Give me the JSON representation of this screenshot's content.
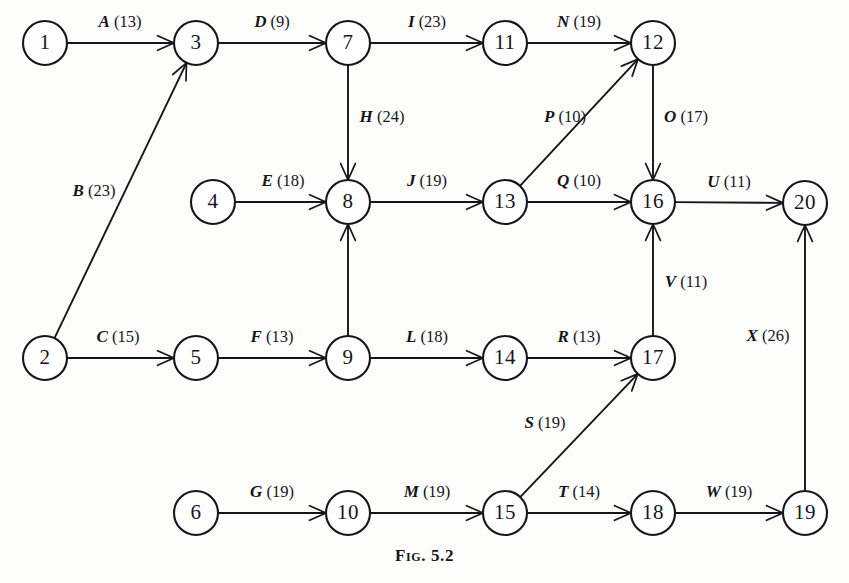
{
  "figure": {
    "caption_word": "Fig.",
    "caption_number": "5.2",
    "width": 849,
    "height": 583,
    "ink_color": "#16161a",
    "background_color": "#fdfdfb"
  },
  "chart_data": {
    "type": "diagram",
    "subtype": "activity-on-arrow-network",
    "node_radius": 22,
    "nodes": [
      {
        "id": "1",
        "label": "1",
        "x": 45,
        "y": 43
      },
      {
        "id": "3",
        "label": "3",
        "x": 196,
        "y": 43
      },
      {
        "id": "7",
        "label": "7",
        "x": 348,
        "y": 43
      },
      {
        "id": "11",
        "label": "11",
        "x": 505,
        "y": 43
      },
      {
        "id": "12",
        "label": "12",
        "x": 653,
        "y": 43
      },
      {
        "id": "4",
        "label": "4",
        "x": 213,
        "y": 202
      },
      {
        "id": "8",
        "label": "8",
        "x": 348,
        "y": 202
      },
      {
        "id": "13",
        "label": "13",
        "x": 505,
        "y": 202
      },
      {
        "id": "16",
        "label": "16",
        "x": 653,
        "y": 202
      },
      {
        "id": "20",
        "label": "20",
        "x": 805,
        "y": 203
      },
      {
        "id": "2",
        "label": "2",
        "x": 45,
        "y": 358
      },
      {
        "id": "5",
        "label": "5",
        "x": 196,
        "y": 358
      },
      {
        "id": "9",
        "label": "9",
        "x": 348,
        "y": 358
      },
      {
        "id": "14",
        "label": "14",
        "x": 505,
        "y": 358
      },
      {
        "id": "17",
        "label": "17",
        "x": 653,
        "y": 358
      },
      {
        "id": "6",
        "label": "6",
        "x": 196,
        "y": 513
      },
      {
        "id": "10",
        "label": "10",
        "x": 348,
        "y": 513
      },
      {
        "id": "15",
        "label": "15",
        "x": 505,
        "y": 513
      },
      {
        "id": "18",
        "label": "18",
        "x": 653,
        "y": 513
      },
      {
        "id": "19",
        "label": "19",
        "x": 805,
        "y": 513
      }
    ],
    "edges": [
      {
        "activity": "A",
        "duration": 13,
        "label": "A (13)",
        "from": "1",
        "to": "3",
        "lx": 120,
        "ly": 23
      },
      {
        "activity": "B",
        "duration": 23,
        "label": "B (23)",
        "from": "2",
        "to": "3",
        "lx": 94,
        "ly": 192
      },
      {
        "activity": "C",
        "duration": 15,
        "label": "C (15)",
        "from": "2",
        "to": "5",
        "lx": 118,
        "ly": 338
      },
      {
        "activity": "D",
        "duration": 9,
        "label": "D (9)",
        "from": "3",
        "to": "7",
        "lx": 272,
        "ly": 23
      },
      {
        "activity": "E",
        "duration": 18,
        "label": "E (18)",
        "from": "4",
        "to": "8",
        "lx": 283,
        "ly": 182
      },
      {
        "activity": "F",
        "duration": 13,
        "label": "F (13)",
        "from": "5",
        "to": "9",
        "lx": 272,
        "ly": 338
      },
      {
        "activity": "G",
        "duration": 19,
        "label": "G (19)",
        "from": "6",
        "to": "10",
        "lx": 272,
        "ly": 493
      },
      {
        "activity": "H",
        "duration": 24,
        "label": "H (24)",
        "from": "7",
        "to": "8",
        "lx": 382,
        "ly": 118
      },
      {
        "activity": "I",
        "duration": 23,
        "label": "I (23)",
        "from": "7",
        "to": "11",
        "lx": 427,
        "ly": 23
      },
      {
        "activity": "J",
        "duration": 19,
        "label": "J (19)",
        "from": "8",
        "to": "13",
        "lx": 427,
        "ly": 182
      },
      {
        "activity": "L",
        "duration": 18,
        "label": "L (18)",
        "from": "9",
        "to": "14",
        "lx": 427,
        "ly": 338
      },
      {
        "activity": "M",
        "duration": 19,
        "label": "M (19)",
        "from": "10",
        "to": "15",
        "lx": 427,
        "ly": 493
      },
      {
        "activity": "N",
        "duration": 19,
        "label": "N (19)",
        "from": "11",
        "to": "12",
        "lx": 579,
        "ly": 23
      },
      {
        "activity": "O",
        "duration": 17,
        "label": "O (17)",
        "from": "12",
        "to": "16",
        "lx": 686,
        "ly": 118
      },
      {
        "activity": "P",
        "duration": 10,
        "label": "P (10)",
        "from": "13",
        "to": "12",
        "lx": 565,
        "ly": 118
      },
      {
        "activity": "Q",
        "duration": 10,
        "label": "Q (10)",
        "from": "13",
        "to": "16",
        "lx": 579,
        "ly": 182
      },
      {
        "activity": "R",
        "duration": 13,
        "label": "R (13)",
        "from": "14",
        "to": "17",
        "lx": 579,
        "ly": 338
      },
      {
        "activity": "S",
        "duration": 19,
        "label": "S (19)",
        "from": "15",
        "to": "17",
        "lx": 545,
        "ly": 424
      },
      {
        "activity": "T",
        "duration": 14,
        "label": "T (14)",
        "from": "15",
        "to": "18",
        "lx": 579,
        "ly": 493
      },
      {
        "activity": "U",
        "duration": 11,
        "label": "U (11)",
        "from": "16",
        "to": "20",
        "lx": 729,
        "ly": 183
      },
      {
        "activity": "V",
        "duration": 11,
        "label": "V (11)",
        "from": "17",
        "to": "16",
        "lx": 686,
        "ly": 283
      },
      {
        "activity": "W",
        "duration": 19,
        "label": "W (19)",
        "from": "18",
        "to": "19",
        "lx": 729,
        "ly": 493
      },
      {
        "activity": "X",
        "duration": 26,
        "label": "X (26)",
        "from": "19",
        "to": "20",
        "lx": 768,
        "ly": 337
      },
      {
        "activity": "",
        "duration": null,
        "label": "",
        "from": "9",
        "to": "8",
        "lx": null,
        "ly": null
      }
    ]
  }
}
